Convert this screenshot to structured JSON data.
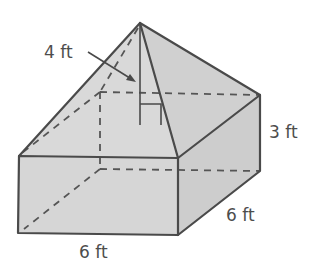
{
  "figure": {
    "type": "composite solid",
    "colors": {
      "background": "#ffffff",
      "edge": "#4a4a4a",
      "front_face": "#d6d6d6",
      "side_face": "#cdcdcd",
      "roof_front": "#d9d9d9",
      "roof_right": "#d0d0d0"
    },
    "labels": {
      "pyramid_height": "4 ft",
      "prism_height": "3 ft",
      "prism_depth": "6 ft",
      "prism_width": "6 ft"
    },
    "dimensions": {
      "pyramid_height_ft": 4,
      "prism_height_ft": 3,
      "prism_depth_ft": 6,
      "prism_width_ft": 6
    }
  }
}
